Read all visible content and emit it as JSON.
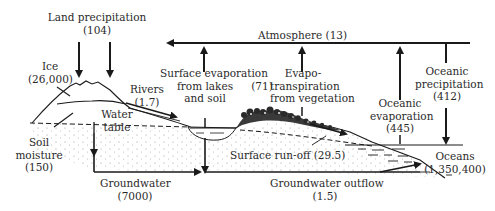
{
  "diagram": {
    "type": "hydrological-cycle",
    "labels": {
      "land_precipitation": {
        "text": "Land precipitation",
        "value": "(104)"
      },
      "ice": {
        "text": "Ice",
        "value": "(26,000)"
      },
      "rivers": {
        "text": "Rivers",
        "value": "(1.7)"
      },
      "water_table": {
        "line1": "Water",
        "line2": "table"
      },
      "soil_moisture": {
        "line1": "Soil",
        "line2": "moisture",
        "value": "(150)"
      },
      "atmosphere": {
        "text": "Atmosphere (13)"
      },
      "surface_evaporation": {
        "line1": "Surface evaporation",
        "line2": "from lakes",
        "line3": "and soil"
      },
      "evapotranspiration": {
        "value": "(71)",
        "line1": "Evapo-",
        "line2": "transpiration",
        "line3": "from vegetation"
      },
      "oceanic_evaporation": {
        "line1": "Oceanic",
        "line2": "evaporation",
        "value": "(445)"
      },
      "oceanic_precipitation": {
        "line1": "Oceanic",
        "line2": "precipitation",
        "value": "(412)"
      },
      "surface_runoff": {
        "text": "Surface run-off (29.5)"
      },
      "oceans": {
        "text": "Oceans",
        "value": "(1,350,400)"
      },
      "groundwater": {
        "text": "Groundwater",
        "value": "(7000)"
      },
      "groundwater_outflow": {
        "text": "Groundwater outflow",
        "value": "(1.5)"
      }
    },
    "colors": {
      "ink": "#1a1a1a",
      "text": "#2a2a2a",
      "background": "#ffffff"
    }
  }
}
